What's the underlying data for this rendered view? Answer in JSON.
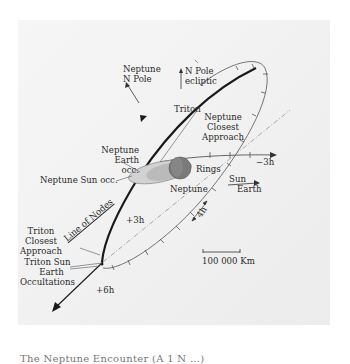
{
  "diagram": {
    "labels": {
      "neptune_n_pole": [
        "Neptune",
        "N Pole"
      ],
      "n_pole_ecliptic": [
        "N Pole",
        "ecliptic"
      ],
      "triton": "Triton",
      "neptune_closest_approach": [
        "Neptune",
        "Closest",
        "Approach"
      ],
      "neptune_earth_occ": [
        "Neptune",
        "Earth",
        "occ."
      ],
      "neptune_sun_occ": "Neptune Sun occ.",
      "rings": "Rings",
      "neptune": "Neptune",
      "sun_earth": [
        "Sun",
        "Earth"
      ],
      "minus_3h": "−3h",
      "plus_3h": "+3h",
      "plus_6h": "+6h",
      "four_h": "4h",
      "line_of_nodes": "Line of Nodes",
      "triton_closest_approach": [
        "Triton",
        "Closest",
        "Approach"
      ],
      "triton_occultations": [
        "Triton Sun",
        "Earth",
        "Occultations"
      ],
      "scale_bar": "100 000 Km"
    },
    "colors": {
      "background": "#f2f2f2",
      "text": "#2a2a2a",
      "trajectory": "#1a1a1a",
      "orbit": "#666666",
      "neptune_body": "#7a7a7a",
      "rings": "#bdbdbd"
    }
  },
  "caption": "The Neptune Encounter (A 1 N ...)"
}
